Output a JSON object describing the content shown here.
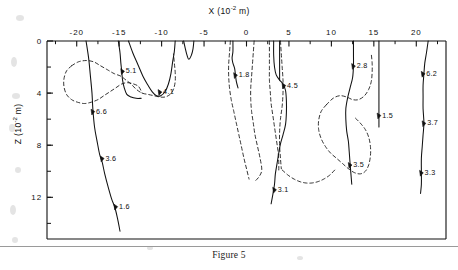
{
  "figure": {
    "caption": "Figure 5",
    "x_axis_title_prefix": "X (10",
    "x_axis_title_exp": "-2",
    "x_axis_title_suffix": " m)",
    "z_axis_title_prefix": "Z (10",
    "z_axis_title_exp": "-2",
    "z_axis_title_suffix": " m)"
  },
  "chart_data": {
    "type": "line",
    "title": "Figure 5",
    "xlabel": "X (10^-2 m)",
    "ylabel": "Z (10^-2 m)",
    "xlim": [
      -23.5,
      23.5
    ],
    "ylim": [
      0,
      15.2
    ],
    "y_axis_direction": "downward",
    "x_axis_position": "top",
    "grid": false,
    "legend": null,
    "x_ticks": [
      -20,
      -15,
      -10,
      -5,
      0,
      5,
      10,
      15,
      20
    ],
    "x_tick_labels": [
      "-20",
      "-15",
      "-10",
      "-5",
      "0",
      "5",
      "10",
      "15",
      "20"
    ],
    "x_minor_tick_interval": 2.5,
    "y_ticks": [
      0,
      4,
      8,
      12
    ],
    "y_tick_labels": [
      "0",
      "4",
      "8",
      "12"
    ],
    "y_minor_tick_interval": 2,
    "annotations": [
      {
        "label": "5.1",
        "x": -14.6,
        "z": 2.3
      },
      {
        "label": "4.1",
        "x": -10.2,
        "z": 3.9
      },
      {
        "label": "6.6",
        "x": -18.1,
        "z": 5.4
      },
      {
        "label": "3.6",
        "x": -17.0,
        "z": 9.0
      },
      {
        "label": "1.6",
        "x": -15.4,
        "z": 12.7
      },
      {
        "label": "1.8",
        "x": -1.3,
        "z": 2.6
      },
      {
        "label": "4.5",
        "x": 4.4,
        "z": 3.4
      },
      {
        "label": "3.1",
        "x": 3.3,
        "z": 11.4
      },
      {
        "label": "2.8",
        "x": 12.6,
        "z": 1.9
      },
      {
        "label": "3.5",
        "x": 12.2,
        "z": 9.5
      },
      {
        "label": "1.5",
        "x": 15.6,
        "z": 5.7
      },
      {
        "label": "6.2",
        "x": 20.8,
        "z": 2.5
      },
      {
        "label": "3.7",
        "x": 20.9,
        "z": 6.3
      },
      {
        "label": "3.3",
        "x": 20.6,
        "z": 10.1
      }
    ],
    "series": [
      {
        "name": "solid-trace-1",
        "style": "solid",
        "points": [
          [
            -18.9,
            0.0
          ],
          [
            -18.6,
            1.3
          ],
          [
            -18.4,
            2.6
          ],
          [
            -18.2,
            4.0
          ],
          [
            -18.1,
            5.2
          ],
          [
            -17.9,
            6.6
          ],
          [
            -17.6,
            7.7
          ],
          [
            -17.3,
            8.7
          ],
          [
            -17.0,
            9.3
          ],
          [
            -16.7,
            10.2
          ],
          [
            -16.3,
            11.2
          ],
          [
            -15.9,
            12.1
          ],
          [
            -15.5,
            12.8
          ],
          [
            -15.2,
            13.6
          ],
          [
            -14.9,
            14.6
          ]
        ]
      },
      {
        "name": "solid-trace-2",
        "style": "solid",
        "points": [
          [
            -15.1,
            0.0
          ],
          [
            -14.9,
            0.9
          ],
          [
            -14.8,
            1.7
          ],
          [
            -14.7,
            2.3
          ],
          [
            -14.6,
            3.0
          ],
          [
            -14.4,
            3.6
          ],
          [
            -14.1,
            4.1
          ],
          [
            -13.6,
            4.3
          ],
          [
            -13.0,
            4.4
          ],
          [
            -12.4,
            4.4
          ]
        ]
      },
      {
        "name": "solid-trace-3",
        "style": "solid",
        "points": [
          [
            -13.9,
            0.0
          ],
          [
            -13.4,
            0.9
          ],
          [
            -12.8,
            1.8
          ],
          [
            -12.2,
            2.7
          ],
          [
            -11.6,
            3.4
          ],
          [
            -11.1,
            3.9
          ],
          [
            -10.6,
            4.2
          ],
          [
            -10.1,
            4.2
          ],
          [
            -9.6,
            3.9
          ],
          [
            -9.2,
            3.3
          ],
          [
            -8.9,
            2.5
          ],
          [
            -8.7,
            1.6
          ],
          [
            -8.5,
            0.8
          ],
          [
            -8.4,
            0.0
          ]
        ]
      },
      {
        "name": "solid-trace-4",
        "style": "solid",
        "points": [
          [
            -7.4,
            0.0
          ],
          [
            -7.2,
            0.6
          ],
          [
            -7.0,
            1.1
          ],
          [
            -6.8,
            1.4
          ],
          [
            -6.5,
            1.1
          ],
          [
            -6.3,
            0.6
          ],
          [
            -6.2,
            0.0
          ]
        ]
      },
      {
        "name": "solid-trace-5",
        "style": "solid",
        "points": [
          [
            -1.6,
            0.0
          ],
          [
            -1.6,
            0.8
          ],
          [
            -1.7,
            1.3
          ],
          [
            -1.6,
            1.7
          ],
          [
            -1.4,
            2.1
          ],
          [
            -1.3,
            2.6
          ],
          [
            -1.2,
            3.1
          ],
          [
            -1.0,
            3.6
          ]
        ]
      },
      {
        "name": "solid-trace-6",
        "style": "solid",
        "points": [
          [
            3.2,
            0.0
          ],
          [
            3.2,
            1.1
          ],
          [
            3.3,
            2.0
          ],
          [
            3.5,
            2.6
          ],
          [
            3.9,
            3.0
          ],
          [
            4.3,
            3.3
          ],
          [
            4.6,
            3.8
          ],
          [
            4.7,
            4.6
          ],
          [
            4.7,
            5.5
          ],
          [
            4.6,
            6.4
          ],
          [
            4.3,
            7.2
          ],
          [
            4.0,
            7.9
          ],
          [
            3.8,
            8.6
          ],
          [
            3.6,
            9.4
          ],
          [
            3.4,
            10.2
          ],
          [
            3.3,
            11.0
          ],
          [
            3.1,
            11.8
          ],
          [
            2.9,
            12.5
          ]
        ]
      },
      {
        "name": "solid-trace-7",
        "style": "solid",
        "points": [
          [
            3.9,
            0.0
          ],
          [
            3.9,
            1.2
          ],
          [
            3.9,
            2.2
          ],
          [
            3.9,
            3.0
          ]
        ]
      },
      {
        "name": "solid-trace-8",
        "style": "solid",
        "points": [
          [
            12.6,
            0.0
          ],
          [
            12.6,
            1.0
          ],
          [
            12.6,
            1.9
          ],
          [
            12.5,
            2.8
          ],
          [
            12.2,
            3.6
          ],
          [
            11.9,
            4.4
          ],
          [
            11.7,
            5.2
          ],
          [
            11.7,
            6.0
          ],
          [
            11.8,
            6.9
          ],
          [
            12.0,
            7.7
          ],
          [
            12.1,
            8.5
          ],
          [
            12.2,
            9.4
          ],
          [
            12.3,
            10.2
          ],
          [
            12.4,
            11.0
          ]
        ]
      },
      {
        "name": "solid-trace-9",
        "style": "solid",
        "points": [
          [
            15.6,
            0.0
          ],
          [
            15.6,
            1.2
          ],
          [
            15.6,
            2.4
          ],
          [
            15.6,
            3.5
          ],
          [
            15.6,
            4.6
          ],
          [
            15.6,
            5.7
          ],
          [
            15.6,
            6.6
          ]
        ]
      },
      {
        "name": "solid-trace-10",
        "style": "solid",
        "points": [
          [
            21.4,
            0.0
          ],
          [
            21.2,
            0.9
          ],
          [
            21.0,
            1.7
          ],
          [
            20.9,
            2.5
          ],
          [
            20.8,
            3.4
          ],
          [
            20.8,
            4.3
          ],
          [
            20.8,
            5.2
          ],
          [
            20.9,
            6.3
          ],
          [
            20.8,
            7.2
          ],
          [
            20.7,
            8.1
          ],
          [
            20.6,
            9.0
          ],
          [
            20.6,
            10.1
          ],
          [
            20.6,
            11.0
          ],
          [
            20.5,
            11.7
          ]
        ]
      },
      {
        "name": "dashed-contour-left",
        "style": "dashed",
        "points": [
          [
            -20.6,
            1.9
          ],
          [
            -19.8,
            1.6
          ],
          [
            -18.9,
            1.5
          ],
          [
            -18.0,
            1.6
          ],
          [
            -17.2,
            1.9
          ],
          [
            -16.4,
            2.2
          ],
          [
            -15.6,
            2.5
          ],
          [
            -14.8,
            2.7
          ],
          [
            -14.2,
            3.0
          ],
          [
            -13.6,
            3.3
          ],
          [
            -13.0,
            3.7
          ],
          [
            -12.3,
            4.0
          ],
          [
            -11.6,
            4.1
          ],
          [
            -10.9,
            4.2
          ],
          [
            -10.2,
            4.3
          ],
          [
            -9.6,
            4.3
          ],
          [
            -9.0,
            4.1
          ],
          [
            -8.6,
            3.7
          ],
          [
            -8.4,
            3.1
          ],
          [
            -8.4,
            2.4
          ],
          [
            -8.5,
            1.7
          ],
          [
            -8.6,
            1.0
          ]
        ]
      },
      {
        "name": "dashed-contour-left-lower",
        "style": "dashed",
        "points": [
          [
            -20.6,
            1.9
          ],
          [
            -21.2,
            2.3
          ],
          [
            -21.5,
            2.9
          ],
          [
            -21.5,
            3.5
          ],
          [
            -21.2,
            4.1
          ],
          [
            -20.6,
            4.5
          ],
          [
            -19.9,
            4.7
          ],
          [
            -19.1,
            4.8
          ],
          [
            -18.3,
            4.7
          ],
          [
            -17.5,
            4.5
          ],
          [
            -16.8,
            4.2
          ],
          [
            -16.1,
            3.9
          ],
          [
            -15.4,
            3.6
          ],
          [
            -14.7,
            3.3
          ],
          [
            -14.0,
            3.2
          ],
          [
            -13.3,
            3.3
          ],
          [
            -12.7,
            3.5
          ],
          [
            -12.3,
            4.0
          ]
        ]
      },
      {
        "name": "dashed-trace-a",
        "style": "dashed",
        "points": [
          [
            -1.9,
            0.0
          ],
          [
            -2.0,
            0.9
          ],
          [
            -2.1,
            1.8
          ],
          [
            -2.1,
            2.7
          ],
          [
            -2.0,
            3.6
          ],
          [
            -1.8,
            4.5
          ],
          [
            -1.5,
            5.4
          ],
          [
            -1.2,
            6.3
          ],
          [
            -0.9,
            7.2
          ],
          [
            -0.6,
            8.1
          ],
          [
            -0.3,
            9.0
          ],
          [
            0.0,
            9.8
          ],
          [
            0.3,
            10.6
          ]
        ]
      },
      {
        "name": "dashed-trace-b",
        "style": "dashed",
        "points": [
          [
            0.9,
            0.0
          ],
          [
            0.8,
            0.9
          ],
          [
            0.7,
            1.8
          ],
          [
            0.6,
            2.7
          ],
          [
            0.5,
            3.6
          ],
          [
            0.5,
            4.5
          ],
          [
            0.6,
            5.4
          ],
          [
            0.8,
            6.3
          ],
          [
            1.0,
            7.2
          ],
          [
            1.3,
            8.1
          ],
          [
            1.6,
            9.0
          ],
          [
            1.8,
            9.9
          ],
          [
            1.5,
            10.4
          ],
          [
            1.1,
            10.7
          ]
        ]
      },
      {
        "name": "dashed-trace-c",
        "style": "dashed",
        "points": [
          [
            2.7,
            0.0
          ],
          [
            2.7,
            1.0
          ],
          [
            2.7,
            2.0
          ],
          [
            2.7,
            3.0
          ],
          [
            2.8,
            3.9
          ],
          [
            2.9,
            4.8
          ],
          [
            3.1,
            5.7
          ],
          [
            3.3,
            6.6
          ],
          [
            3.5,
            7.5
          ],
          [
            3.7,
            8.4
          ],
          [
            3.8,
            9.3
          ],
          [
            3.8,
            10.0
          ]
        ]
      },
      {
        "name": "dashed-trace-d",
        "style": "dashed",
        "points": [
          [
            4.0,
            0.0
          ],
          [
            4.1,
            1.0
          ],
          [
            4.2,
            2.0
          ],
          [
            4.3,
            3.0
          ],
          [
            4.3,
            4.0
          ],
          [
            4.2,
            5.0
          ],
          [
            4.0,
            6.0
          ],
          [
            3.9,
            7.0
          ],
          [
            3.9,
            8.0
          ],
          [
            4.0,
            9.0
          ],
          [
            4.1,
            9.8
          ]
        ]
      },
      {
        "name": "dashed-contour-right",
        "style": "dashed",
        "points": [
          [
            9.4,
            4.9
          ],
          [
            10.2,
            4.4
          ],
          [
            11.0,
            4.2
          ],
          [
            11.8,
            4.3
          ],
          [
            12.5,
            4.5
          ],
          [
            13.2,
            4.5
          ],
          [
            13.9,
            4.2
          ],
          [
            14.4,
            3.7
          ],
          [
            14.7,
            3.1
          ],
          [
            14.8,
            2.4
          ],
          [
            14.8,
            1.7
          ],
          [
            14.7,
            1.0
          ]
        ]
      },
      {
        "name": "dashed-contour-right-lower",
        "style": "dashed",
        "points": [
          [
            9.4,
            4.9
          ],
          [
            8.8,
            5.4
          ],
          [
            8.5,
            6.1
          ],
          [
            8.5,
            6.8
          ],
          [
            8.8,
            7.5
          ],
          [
            9.3,
            8.1
          ],
          [
            9.9,
            8.6
          ],
          [
            10.6,
            9.0
          ],
          [
            11.3,
            9.4
          ],
          [
            12.0,
            9.8
          ],
          [
            12.7,
            10.1
          ],
          [
            13.4,
            10.2
          ],
          [
            14.0,
            10.0
          ],
          [
            14.4,
            9.5
          ],
          [
            14.6,
            8.8
          ],
          [
            14.6,
            8.1
          ],
          [
            14.4,
            7.4
          ],
          [
            14.0,
            6.8
          ],
          [
            13.4,
            6.3
          ],
          [
            12.8,
            5.9
          ]
        ]
      },
      {
        "name": "dashed-contour-center-low",
        "style": "dashed",
        "points": [
          [
            4.2,
            9.9
          ],
          [
            4.9,
            10.3
          ],
          [
            5.6,
            10.6
          ],
          [
            6.3,
            10.8
          ],
          [
            7.0,
            10.9
          ],
          [
            7.7,
            10.9
          ],
          [
            8.4,
            10.8
          ],
          [
            9.1,
            10.6
          ],
          [
            9.8,
            10.3
          ],
          [
            10.4,
            9.9
          ]
        ]
      }
    ]
  }
}
